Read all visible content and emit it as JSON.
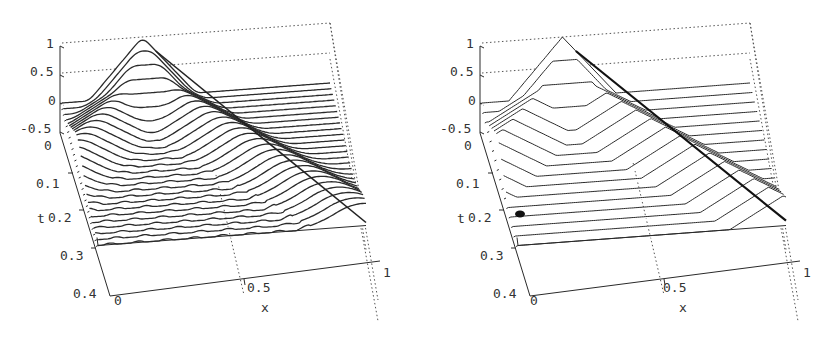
{
  "figure": {
    "background": "#ffffff",
    "line_color": "#2a2a2a",
    "grid_color": "#555555"
  },
  "chart_data": [
    {
      "type": "waterfall-3d",
      "title": "",
      "xlabel": "x",
      "ylabel": "t",
      "zlabel": "",
      "x_range": [
        0,
        1
      ],
      "t_range": [
        0,
        0.4
      ],
      "z_range": [
        -0.5,
        1
      ],
      "x_ticks": [
        "0",
        "0.5",
        "1"
      ],
      "t_ticks": [
        "0",
        "0.1",
        "0.2",
        "0.3",
        "0.4"
      ],
      "z_ticks": [
        "1",
        "0.5",
        "0",
        "-0.5"
      ],
      "grid": "dotted back walls",
      "n_slices": 26,
      "t_max_plotted": 0.3,
      "initial_profile": "triangular pulse centered at x=0.3, height 1, half-width 0.2",
      "description": "Smooth solution: pulse splits into two smoothed waves moving left and right, with small oscillations in the middle",
      "profile_style": "smooth"
    },
    {
      "type": "waterfall-3d",
      "title": "",
      "xlabel": "x",
      "ylabel": "t",
      "zlabel": "",
      "x_range": [
        0,
        1
      ],
      "t_range": [
        0,
        0.4
      ],
      "z_range": [
        -0.5,
        1
      ],
      "x_ticks": [
        "0",
        "0.5",
        "1"
      ],
      "t_ticks": [
        "0",
        "0.1",
        "0.2",
        "0.3",
        "0.4"
      ],
      "z_ticks": [
        "1",
        "0.5",
        "0",
        "-0.5"
      ],
      "grid": "dotted back walls",
      "n_slices": 16,
      "t_max_plotted": 0.3,
      "initial_profile": "triangular pulse centered at x=0.3, height 1, half-width 0.2",
      "description": "Sharp solution: pulse splits into two half-height triangular waves moving left and right, flat between",
      "profile_style": "sharp"
    }
  ],
  "panels": [
    {
      "offset_x": 0,
      "labels": {
        "z1": "1",
        "z05": "0.5",
        "z0": "0",
        "zm05": "-0.5",
        "t0": "0",
        "t01": "0.1",
        "t02": "0.2",
        "t03": "0.3",
        "t04": "0.4",
        "x0": "0",
        "x05": "0.5",
        "x1": "1",
        "xlabel": "x",
        "tlabel": "t"
      }
    },
    {
      "offset_x": 420,
      "labels": {
        "z1": "1",
        "z05": "0.5",
        "z0": "0",
        "zm05": "-0.5",
        "t0": "0",
        "t01": "0.1",
        "t02": "0.2",
        "t03": "0.3",
        "t04": "0.4",
        "x0": "0",
        "x05": "0.5",
        "x1": "1",
        "xlabel": "x",
        "tlabel": "t"
      }
    }
  ]
}
